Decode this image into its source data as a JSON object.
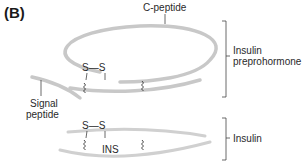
{
  "panel_label": "(B)",
  "labels": {
    "c_peptide": "C-peptide",
    "signal_peptide_line1": "Signal",
    "signal_peptide_line2": "peptide",
    "insulin_preprohormone_line1": "Insulin",
    "insulin_preprohormone_line2": "preprohormone",
    "insulin": "Insulin",
    "ins": "INS",
    "disulfide_top": "S—S",
    "disulfide_bottom": "S—S"
  },
  "colors": {
    "strand": "#c8c8c8",
    "line": "#444444",
    "text": "#2a2a2a"
  }
}
